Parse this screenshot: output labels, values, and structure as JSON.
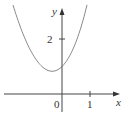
{
  "chart_data": {
    "type": "line",
    "title": "",
    "xlabel": "x",
    "ylabel": "y",
    "x_ticks": [
      {
        "value": 0,
        "label": "0"
      },
      {
        "value": 1,
        "label": "1"
      }
    ],
    "y_ticks": [
      {
        "value": 2,
        "label": "2"
      }
    ],
    "xlim": [
      -2.2,
      2.1
    ],
    "ylim": [
      -0.8,
      3.2
    ],
    "grid": false,
    "series": [
      {
        "name": "curve",
        "function": "x^2 + e^x",
        "color": "#8a8a8a"
      }
    ]
  },
  "labels": {
    "x_axis": "x",
    "y_axis": "y",
    "origin": "0",
    "x_tick_1": "1",
    "y_tick_2": "2"
  }
}
